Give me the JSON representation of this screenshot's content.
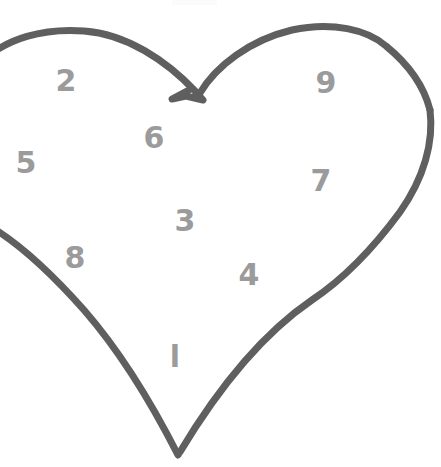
{
  "canvas": {
    "width": 441,
    "height": 467,
    "background_color": "#ffffff"
  },
  "drawing": {
    "name": "hand-drawn-heart-outline",
    "stroke_color": "#5f5f5f",
    "stroke_width": 7,
    "description": "Hand-drawn heart outline, clipped at the left edge of the canvas, with a notched cleft at the top center and a pointed bottom tip.",
    "paths": [
      {
        "id": "heart-left-lobe-and-side",
        "d": "M -18 62 C 6 38 44 28 84 31 C 126 34 166 60 196 92 L 203 100 L 186 96 L 172 99 L 189 90"
      },
      {
        "id": "heart-right-lobe",
        "d": "M 200 93 C 216 66 250 40 292 30 C 332 21 368 30 386 46 C 408 64 424 86 430 110"
      },
      {
        "id": "heart-right-side",
        "d": "M 430 110 C 434 142 424 178 400 212 C 372 250 342 280 312 300 C 268 330 222 382 180 452"
      },
      {
        "id": "heart-left-side",
        "d": "M -14 224 C 20 243 52 274 84 310 C 118 349 150 400 178 455"
      }
    ]
  },
  "labels": [
    {
      "id": "label-2",
      "text": "2",
      "x": 66,
      "y": 81,
      "font_size": 30
    },
    {
      "id": "label-9",
      "text": "9",
      "x": 326,
      "y": 83,
      "font_size": 30
    },
    {
      "id": "label-6",
      "text": "6",
      "x": 154,
      "y": 138,
      "font_size": 30
    },
    {
      "id": "label-5",
      "text": "5",
      "x": 26,
      "y": 163,
      "font_size": 30
    },
    {
      "id": "label-7",
      "text": "7",
      "x": 321,
      "y": 181,
      "font_size": 30
    },
    {
      "id": "label-3",
      "text": "3",
      "x": 185,
      "y": 221,
      "font_size": 30
    },
    {
      "id": "label-8",
      "text": "8",
      "x": 75,
      "y": 258,
      "font_size": 30
    },
    {
      "id": "label-4",
      "text": "4",
      "x": 249,
      "y": 275,
      "font_size": 30
    },
    {
      "id": "label-1",
      "text": "l",
      "x": 175,
      "y": 357,
      "font_size": 30
    }
  ],
  "label_color": "#9b9b9b",
  "artifact": {
    "id": "faint-top-mark",
    "x": 172,
    "y": 0,
    "width": 45,
    "height": 5,
    "color": "#fbfbfb"
  }
}
